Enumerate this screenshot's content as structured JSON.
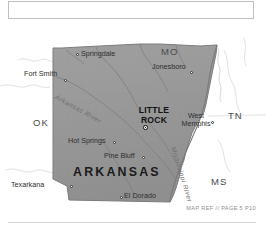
{
  "map": {
    "title_region": "",
    "state_name": "ARKANSAS",
    "capital": {
      "name_line1": "LITTLE",
      "name_line2": "ROCK"
    },
    "cities": [
      {
        "name": "Springdale",
        "dot_x": 76,
        "dot_y": 33,
        "label_x": 81,
        "label_y": 30,
        "anchor": "left"
      },
      {
        "name": "Fort Smith",
        "dot_x": 64,
        "dot_y": 59,
        "label_x": 62,
        "label_y": 50,
        "anchor": "right"
      },
      {
        "name": "Jonesboro",
        "dot_x": 190,
        "dot_y": 51,
        "label_x": 186,
        "label_y": 43,
        "anchor": "right"
      },
      {
        "name": "Hot Springs",
        "dot_x": 113,
        "dot_y": 121,
        "label_x": 110,
        "label_y": 117,
        "anchor": "right"
      },
      {
        "name": "Pine Bluff",
        "dot_x": 142,
        "dot_y": 136,
        "label_x": 139,
        "label_y": 132,
        "anchor": "right"
      },
      {
        "name": "Texarkana",
        "dot_x": 70,
        "dot_y": 165,
        "label_x": 67,
        "label_y": 161,
        "anchor": "right"
      },
      {
        "name": "El Dorado",
        "dot_x": 120,
        "dot_y": 176,
        "label_x": 124,
        "label_y": 172,
        "anchor": "left"
      }
    ],
    "west_memphis": {
      "name_line1": "West",
      "name_line2": "Memphis",
      "dot_x": 211,
      "dot_y": 101
    },
    "neighbor_states": [
      {
        "abbr": "MO",
        "x": 161,
        "y": 27
      },
      {
        "abbr": "TN",
        "x": 228,
        "y": 91
      },
      {
        "abbr": "MS",
        "x": 211,
        "y": 157
      },
      {
        "abbr": "LA",
        "x": 116,
        "y": 194
      },
      {
        "abbr": "OK",
        "x": 33,
        "y": 98
      }
    ],
    "rivers": [
      {
        "name": "Arkansas River"
      },
      {
        "name": "Mississippi River"
      }
    ],
    "footer_credit": "MAP REF // PAGE 5 P10",
    "colors": {
      "state_fill": "#969696",
      "state_fill_light": "#a3a3a3",
      "state_border": "#6d6d6d",
      "water": "#8f8f8f",
      "background": "#ffffff",
      "text": "#2e2e2e",
      "muted_text": "#8e8e8e"
    }
  }
}
